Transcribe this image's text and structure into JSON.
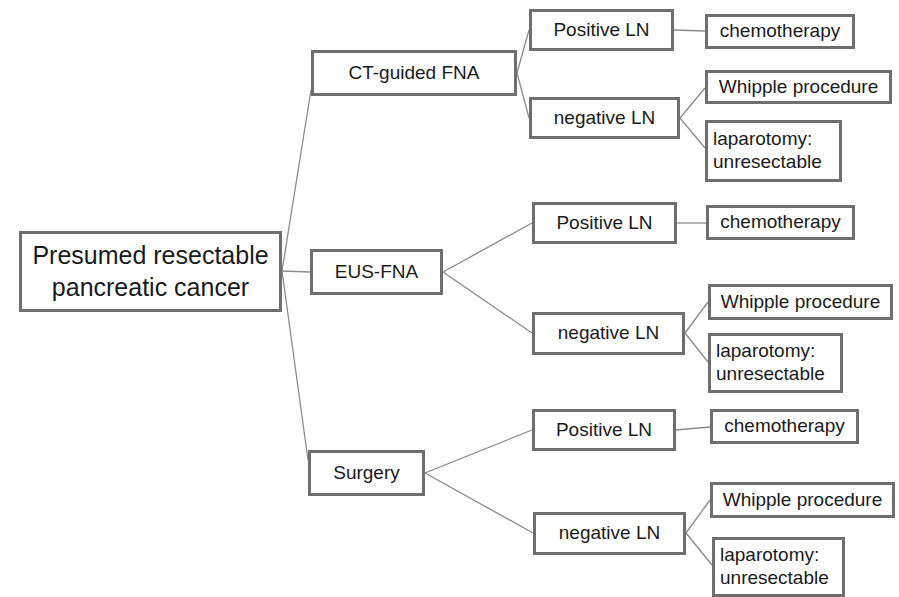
{
  "diagram": {
    "type": "decision-tree",
    "root": {
      "label": "Presumed resectable\npancreatic cancer"
    },
    "branches": [
      {
        "label": "CT-guided FNA",
        "positive": {
          "label": "Positive LN",
          "outcome": "chemotherapy"
        },
        "negative": {
          "label": "negative LN",
          "outcomes": [
            "Whipple procedure",
            "laparotomy:\nunresectable"
          ]
        }
      },
      {
        "label": "EUS-FNA",
        "positive": {
          "label": "Positive LN",
          "outcome": "chemotherapy"
        },
        "negative": {
          "label": "negative LN",
          "outcomes": [
            "Whipple procedure",
            "laparotomy:\nunresectable"
          ]
        }
      },
      {
        "label": "Surgery",
        "positive": {
          "label": "Positive LN",
          "outcome": "chemotherapy"
        },
        "negative": {
          "label": "negative LN",
          "outcomes": [
            "Whipple procedure",
            "laparotomy:\nunresectable"
          ]
        }
      }
    ]
  },
  "colors": {
    "border": "#6e6e6e",
    "edge": "#8a8a8a",
    "text": "#1a1a1a",
    "background": "#ffffff"
  }
}
